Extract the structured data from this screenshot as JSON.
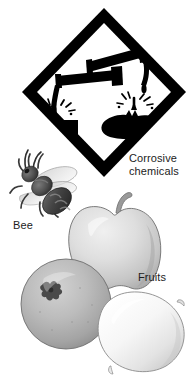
{
  "figure": {
    "background_color": "#ffffff",
    "width": 194,
    "height": 383
  },
  "pictogram": {
    "name": "corrosive-hazard-diamond",
    "shape": "diamond",
    "border_color": "#000000",
    "fill_color": "#ffffff",
    "symbol_color": "#000000",
    "elements": [
      "test-tube-upper",
      "test-tube-lower",
      "liquid-drip-left",
      "liquid-drip-right",
      "corroded-slab",
      "corroded-hand",
      "splash-left",
      "splash-right"
    ]
  },
  "labels": {
    "corrosive": "Corrosive\nchemicals",
    "bee": "Bee",
    "fruits": "Fruits"
  },
  "illustrations": {
    "bee": {
      "name": "bee",
      "body_color": "#4a4a4a",
      "wing_color": "#d8d8d8"
    },
    "apple": {
      "name": "apple",
      "fill_color": "#dcdcdc",
      "outline_color": "#707070",
      "stem_color": "#9a9a9a"
    },
    "orange": {
      "name": "orange",
      "fill_color": "#b4b4b4",
      "outline_color": "#6e6e6e",
      "calyx_color": "#4f4f4f"
    },
    "lemon": {
      "name": "lemon",
      "fill_color": "#f4f4f4",
      "outline_color": "#8a8a8a"
    }
  }
}
